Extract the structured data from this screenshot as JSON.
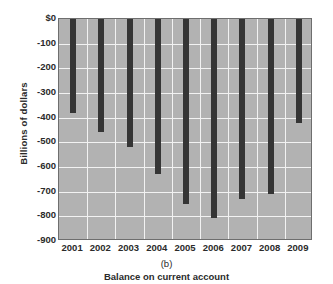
{
  "chart_data": {
    "type": "bar",
    "title": "",
    "subtitle": "",
    "panel_letter": "(b)",
    "caption": "Balance on current account",
    "xlabel": "",
    "ylabel": "Billions of dollars",
    "categories": [
      "2001",
      "2002",
      "2003",
      "2004",
      "2005",
      "2006",
      "2007",
      "2008",
      "2009"
    ],
    "values": [
      -380,
      -460,
      -520,
      -630,
      -750,
      -805,
      -730,
      -710,
      -420
    ],
    "series": [
      {
        "name": "Balance on current account",
        "values": [
          -380,
          -460,
          -520,
          -630,
          -750,
          -805,
          -730,
          -710,
          -420
        ]
      }
    ],
    "ylim": [
      -900,
      0
    ],
    "ytick_values": [
      0,
      -100,
      -200,
      -300,
      -400,
      -500,
      -600,
      -700,
      -800,
      -900
    ],
    "ytick_labels": [
      "$0",
      "-100",
      "-200",
      "-300",
      "-400",
      "-500",
      "-600",
      "-700",
      "-800",
      "-900"
    ],
    "grid": true,
    "legend": "none",
    "bar_color": "#353535",
    "plot_background": "#b2b2b2",
    "grid_color": "#f2f2f2",
    "axis_color": "#6e6e6e"
  }
}
